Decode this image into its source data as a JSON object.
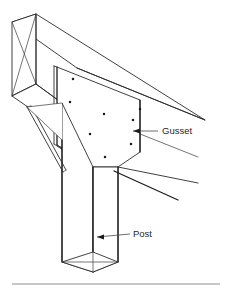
{
  "figure": {
    "kind": "isometric-line-drawing",
    "background_color": "#ffffff",
    "line_color": "#2b2b2b",
    "width": 232,
    "height": 294
  },
  "annotations": [
    {
      "id": "gusset",
      "label": "Gusset",
      "label_x": 162,
      "label_y": 131,
      "leader_start_x": 158,
      "leader_start_y": 131,
      "leader_end_x": 133,
      "leader_end_y": 131,
      "arrow_at": "left",
      "points_to": "gusset-plate"
    },
    {
      "id": "post",
      "label": "Post",
      "label_x": 133,
      "label_y": 234,
      "leader_start_x": 130,
      "leader_start_y": 234,
      "leader_end_x": 97,
      "leader_end_y": 237,
      "arrow_at": "left",
      "points_to": "post-column"
    }
  ],
  "parts": {
    "beam": {
      "name": "Beam",
      "end_face_cross_bracing": true
    },
    "gusset_plate": {
      "name": "Gusset plate",
      "bolt_hole_count": 8,
      "bolt_hole_color": "#1b1b1b"
    },
    "post": {
      "name": "Post",
      "bottom_end_cap": "diamond-with-diagonals"
    },
    "brace_left": {
      "name": "Left diagonal brace"
    },
    "brace_right": {
      "name": "Right diagonal brace"
    },
    "ground_line": {
      "name": "Ground reference line",
      "color": "#8d8d8d"
    }
  },
  "bolt_holes": [
    {
      "x": 73,
      "y": 79,
      "r": 1.25
    },
    {
      "x": 70,
      "y": 102,
      "r": 1.25
    },
    {
      "x": 104,
      "y": 114,
      "r": 1.25
    },
    {
      "x": 133,
      "y": 120,
      "r": 1.25
    },
    {
      "x": 90,
      "y": 134,
      "r": 1.25
    },
    {
      "x": 131,
      "y": 144,
      "r": 1.25
    },
    {
      "x": 105,
      "y": 157,
      "r": 1.25
    },
    {
      "x": 140,
      "y": 109,
      "r": 1.25
    }
  ]
}
